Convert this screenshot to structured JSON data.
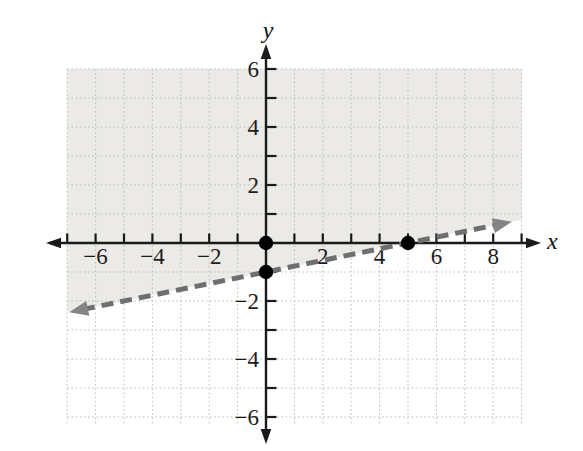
{
  "chart_data": {
    "type": "line",
    "title": "",
    "grid": true,
    "grid_x_range": [
      -7,
      9
    ],
    "grid_y_range": [
      -6.3,
      6
    ],
    "x_axis": {
      "label": "x",
      "labeled_ticks": [
        {
          "v": -6,
          "t": "−6"
        },
        {
          "v": -4,
          "t": "−4"
        },
        {
          "v": -2,
          "t": "−2"
        },
        {
          "v": 2,
          "t": "2"
        },
        {
          "v": 4,
          "t": "4"
        },
        {
          "v": 6,
          "t": "6"
        },
        {
          "v": 8,
          "t": "8"
        }
      ],
      "minor_tick_range": [
        -7,
        9
      ]
    },
    "y_axis": {
      "label": "y",
      "labeled_ticks": [
        {
          "v": 6,
          "t": "6"
        },
        {
          "v": 4,
          "t": "4"
        },
        {
          "v": 2,
          "t": "2"
        },
        {
          "v": -2,
          "t": "−2"
        },
        {
          "v": -4,
          "t": "−4"
        },
        {
          "v": -6,
          "t": "−6"
        }
      ],
      "minor_tick_range": [
        -6,
        6
      ]
    },
    "boundary_line": {
      "equation": "y = (1/5)x − 1",
      "slope": 0.2,
      "y_intercept": -1,
      "style": "dashed",
      "arrows": "both",
      "x_start": -6.93,
      "x_end": 8.66,
      "color": "#6f6f6f",
      "arrow_color": "#848484",
      "stroke_width": 5,
      "dash": [
        12,
        7
      ]
    },
    "points": [
      {
        "x": 0,
        "y": 0
      },
      {
        "x": 0,
        "y": -1
      },
      {
        "x": 5,
        "y": 0
      }
    ],
    "point_radius": 7.2,
    "shading": {
      "region": "above boundary line",
      "color": "#ebeae6",
      "x_range": [
        -7,
        9
      ],
      "y_top": 6
    },
    "colors": {
      "axis": "#1a1a1a",
      "grid": "#bdbdb9",
      "point": "#000000",
      "background": "#ffffff"
    }
  }
}
